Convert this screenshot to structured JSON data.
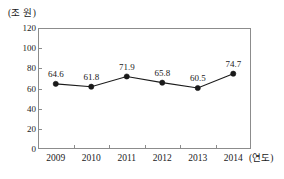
{
  "chart_data": {
    "type": "line",
    "title": "",
    "xlabel": "(연도)",
    "ylabel": "(조 원)",
    "categories": [
      "2009",
      "2010",
      "2011",
      "2012",
      "2013",
      "2014"
    ],
    "values": [
      64.6,
      61.8,
      71.9,
      65.8,
      60.5,
      74.7
    ],
    "value_labels": [
      "64.6",
      "61.8",
      "71.9",
      "65.8",
      "60.5",
      "74.7"
    ],
    "ylim": [
      0,
      120
    ],
    "yticks": [
      0,
      20,
      40,
      60,
      80,
      100,
      120
    ],
    "ytick_labels": [
      "0",
      "20",
      "40",
      "60",
      "80",
      "100",
      "120"
    ],
    "grid": false,
    "legend": false,
    "marker": "circle",
    "series": [
      {
        "name": "",
        "values": [
          64.6,
          61.8,
          71.9,
          65.8,
          60.5,
          74.7
        ]
      }
    ],
    "colors": {
      "line": "#1a1a1a",
      "marker": "#1a1a1a",
      "frame": "#8c8c8c",
      "background": "#ffffff",
      "text": "#1a1a1a"
    }
  }
}
